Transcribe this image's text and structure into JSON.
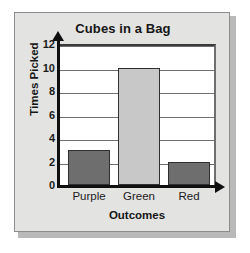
{
  "chart_data": {
    "type": "bar",
    "title": "Cubes in a Bag",
    "xlabel": "Outcomes",
    "ylabel": "Times Picked",
    "categories": [
      "Purple",
      "Green",
      "Red"
    ],
    "values": [
      3,
      10,
      2
    ],
    "ylim": [
      0,
      12
    ],
    "yticks": [
      0,
      2,
      4,
      6,
      8,
      10,
      12
    ],
    "ytick_labels": [
      "0",
      "2",
      "4",
      "6",
      "8",
      "10",
      "12"
    ],
    "grid": true,
    "legend": "none",
    "bar_colors": [
      "#6e6e6e",
      "#c8c8c8",
      "#6e6e6e"
    ],
    "bar_border_color": "#2f2f2f",
    "plot_background": "#ffffff",
    "panel_background": "#e3e3e1",
    "axis_color": "#101010",
    "gridline_color": "#6f6f6f"
  }
}
